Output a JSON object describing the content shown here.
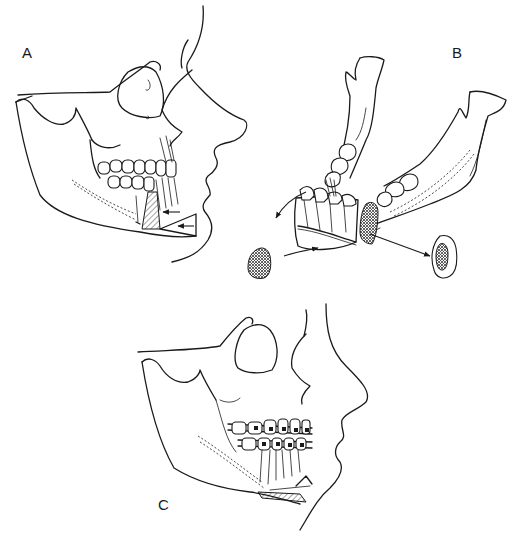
{
  "figure": {
    "type": "medical line illustration",
    "colors": {
      "line": "#1a1a1a",
      "background": "#ffffff"
    }
  },
  "panels": [
    {
      "label": "A",
      "description": "Lateral skull and facial profile showing vertical anterior mandibular osteotomy cut (hatched wedge) and arrows indicating segment movement and chin wedge repositioning"
    },
    {
      "label": "B",
      "description": "Oblique view of mandible with anterior dentoalveolar segment mobilized; curved arrows show rotation; two bone graft blocks harvested and removed"
    },
    {
      "label": "C",
      "description": "Lateral skull and profile after repositioning, with orthodontic arch wires and brackets on upper and lower teeth, wire fixation at the chin and hatched graft site"
    }
  ]
}
